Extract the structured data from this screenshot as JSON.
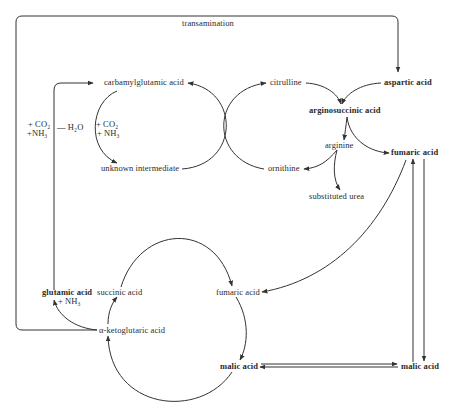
{
  "diagram": {
    "type": "metabolic-pathway",
    "nodes": {
      "transamination": "transamination",
      "carbamylglutamic_acid": "carbamylglutamic acid",
      "citrulline": "citrulline",
      "aspartic_acid": "aspartic acid",
      "arginosuccinic_acid": "arginosuccinic acid",
      "unknown_intermediate": "unknown intermediate",
      "ornithine": "ornithine",
      "arginine": "arginine",
      "fumaric_acid_top": "fumaric acid",
      "substituted_urea": "substituted urea",
      "glutamic_acid": "glutamic acid",
      "nh3_glutamic": "+ NH₃",
      "succinic_acid": "succinic acid",
      "fumaric_acid_mid": "fumaric acid",
      "ketoglutaric_acid": "α-ketoglutaric acid",
      "malic_acid_bottom": "malic acid",
      "malic_acid_right": "malic acid"
    },
    "annotations": {
      "left_co2": "+ CO₂",
      "left_nh3": "+NH₃",
      "minus_h2o": "— H₂O",
      "inner_co2": "+ CO₂",
      "inner_nh3": "+ NH₃"
    },
    "edges": [
      {
        "from": "α-ketoglutaric acid",
        "to": "aspartic acid",
        "label": "transamination"
      },
      {
        "from": "glutamic acid",
        "to": "carbamylglutamic acid",
        "label": "+ CO₂ + NH₃ — H₂O"
      },
      {
        "from": "carbamylglutamic acid",
        "to": "unknown intermediate",
        "label": "+ CO₂ + NH₃"
      },
      {
        "from": "unknown intermediate",
        "to": "carbamylglutamic acid"
      },
      {
        "from": "ornithine",
        "to": "citrulline"
      },
      {
        "from": "citrulline",
        "to": "arginosuccinic acid"
      },
      {
        "from": "aspartic acid",
        "to": "arginosuccinic acid"
      },
      {
        "from": "arginosuccinic acid",
        "to": "arginine"
      },
      {
        "from": "arginosuccinic acid",
        "to": "fumaric acid"
      },
      {
        "from": "arginine",
        "to": "ornithine"
      },
      {
        "from": "arginine",
        "to": "substituted urea"
      },
      {
        "from": "fumaric acid",
        "to": "fumaric acid (cycle)"
      },
      {
        "from": "fumaric acid",
        "to": "malic acid (right)"
      },
      {
        "from": "malic acid (right)",
        "to": "fumaric acid"
      },
      {
        "from": "malic acid (cycle)",
        "to": "malic acid (right)"
      },
      {
        "from": "malic acid (right)",
        "to": "malic acid (cycle)"
      },
      {
        "from": "fumaric acid (cycle)",
        "to": "malic acid (cycle)"
      },
      {
        "from": "malic acid (cycle)",
        "to": "α-ketoglutaric acid"
      },
      {
        "from": "α-ketoglutaric acid",
        "to": "succinic acid"
      },
      {
        "from": "succinic acid",
        "to": "fumaric acid (cycle)"
      },
      {
        "from": "α-ketoglutaric acid",
        "to": "glutamic acid + NH₃"
      }
    ]
  }
}
